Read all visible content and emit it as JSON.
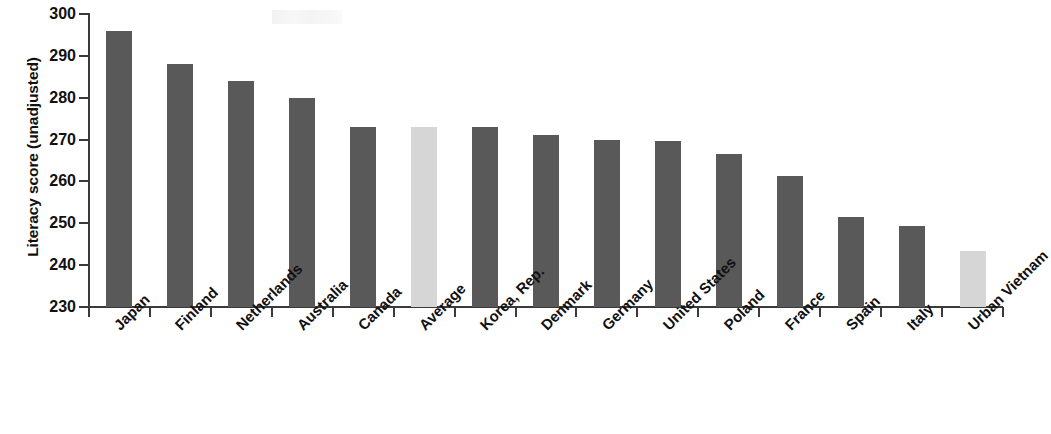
{
  "chart_data": {
    "type": "bar",
    "title": "",
    "xlabel": "",
    "ylabel": "Literacy score (unadjusted)",
    "ylim": [
      230,
      300
    ],
    "ytick_values": [
      300,
      290,
      280,
      270,
      260,
      250,
      240,
      230
    ],
    "ytick_labels": [
      "300",
      "290",
      "280",
      "270",
      "260",
      "250",
      "240",
      "230"
    ],
    "grid": false,
    "legend": null,
    "categories": [
      "Japan",
      "Finland",
      "Netherlands",
      "Australia",
      "Canada",
      "Average",
      "Korea, Rep.",
      "Denmark",
      "Germany",
      "United States",
      "Poland",
      "France",
      "Spain",
      "Italy",
      "Urban Vietnam"
    ],
    "values": [
      296,
      288,
      284,
      280,
      273,
      273,
      273,
      271,
      269.8,
      269.7,
      266.5,
      261.4,
      251.4,
      249.4,
      243.5
    ],
    "bar_styles": [
      "dark",
      "dark",
      "dark",
      "dark",
      "dark",
      "light",
      "dark",
      "dark",
      "dark",
      "dark",
      "dark",
      "dark",
      "dark",
      "dark",
      "light"
    ],
    "colors": {
      "bar_dark": "#595959",
      "bar_light": "#d6d6d6",
      "axis": "#3a3a3a",
      "text": "#111111",
      "background": "#ffffff"
    }
  }
}
